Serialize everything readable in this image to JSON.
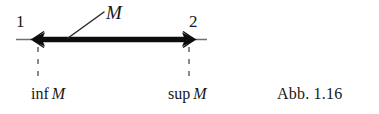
{
  "figure": {
    "caption": "Abb. 1.16",
    "background_color": "#ffffff",
    "ink_color": "#171717",
    "set_label": "M",
    "endpoints": [
      {
        "index_label": "1",
        "bound_operator": "inf",
        "bound_set": "M",
        "role": "infimum"
      },
      {
        "index_label": "2",
        "bound_operator": "sup",
        "bound_set": "M",
        "role": "supremum"
      }
    ],
    "axis": {
      "line_color": "#6f6f6f",
      "interval_color": "#0d0d0d"
    }
  }
}
